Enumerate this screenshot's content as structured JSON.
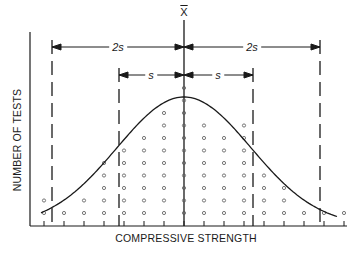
{
  "chart_data": {
    "type": "scatter",
    "title": "",
    "xlabel": "COMPRESSIVE STRENGTH",
    "ylabel": "NUMBER OF TESTS",
    "mean_label": "X",
    "bins": [
      1,
      2,
      3,
      4,
      5,
      6,
      7,
      8,
      9,
      10,
      11,
      12,
      13,
      14,
      15,
      16
    ],
    "counts": [
      2,
      1,
      2,
      5,
      6,
      7,
      9,
      11,
      8,
      7,
      8,
      4,
      3,
      1,
      1,
      1
    ],
    "mean_bin": 8,
    "annotations": [
      {
        "label": "2s",
        "from": "-2s",
        "to": "mean"
      },
      {
        "label": "2s",
        "from": "mean",
        "to": "+2s"
      },
      {
        "label": "s",
        "from": "-s",
        "to": "mean"
      },
      {
        "label": "s",
        "from": "mean",
        "to": "+s"
      }
    ],
    "reference_lines": [
      "-2s",
      "-s",
      "mean",
      "+s",
      "+2s"
    ],
    "curve": "normal distribution",
    "grid": false
  },
  "labels": {
    "x_axis": "COMPRESSIVE STRENGTH",
    "y_axis": "NUMBER OF TESTS",
    "mean": "X",
    "two_s_left": "2s",
    "two_s_right": "2s",
    "s_left": "s",
    "s_right": "s"
  }
}
